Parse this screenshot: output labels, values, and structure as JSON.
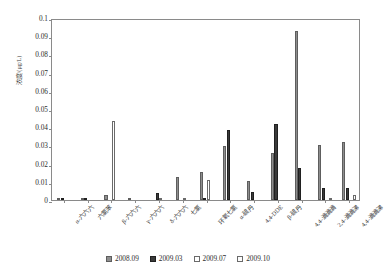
{
  "chart_data": {
    "type": "bar",
    "title": "",
    "xlabel": "",
    "ylabel": "浓度/(μg/L)",
    "ylim": [
      0,
      0.1
    ],
    "ytick_values": [
      0,
      0.01,
      0.02,
      0.03,
      0.04,
      0.05,
      0.06,
      0.07,
      0.08,
      0.09,
      0.1
    ],
    "ytick_labels": [
      "0",
      "0.01",
      "0.02",
      "0.03",
      "0.04",
      "0.05",
      "0.06",
      "0.07",
      "0.08",
      "0.09",
      "0.1"
    ],
    "grid": false,
    "legend_position": "bottom",
    "categories": [
      "α-六六六",
      "六氯苯",
      "β-六六六",
      "γ-六六六",
      "δ-六六六",
      "七氯",
      "环氧七氯",
      "α-硫丹",
      "4,4-DDE",
      "β-硫丹",
      "4,4-滴滴滴",
      "2,4-滴滴涕",
      "4,4-滴滴涕"
    ],
    "series": [
      {
        "name": "2008.09",
        "color": "#8e8e8e",
        "values": [
          0.0004,
          0.0003,
          0.0028,
          0.0012,
          0.0,
          0.0128,
          0.0155,
          0.0297,
          0.0105,
          0.0259,
          0.0928,
          0.0305,
          0.0318
        ]
      },
      {
        "name": "2009.03",
        "color": "#3a3a3a",
        "values": [
          0.0002,
          0.0005,
          0.0,
          0.0,
          0.0039,
          0.0,
          0.0013,
          0.0387,
          0.0044,
          0.0415,
          0.0174,
          0.0068,
          0.0068
        ]
      },
      {
        "name": "2009.07",
        "color": "#ffffff",
        "values": [
          0.0,
          0.0,
          0.0435,
          0.0,
          0.0004,
          0.0005,
          0.0108,
          0.0,
          0.0,
          0.0,
          0.0,
          0.0,
          0.0
        ]
      },
      {
        "name": "2009.10",
        "color": "#fcfcfc",
        "values": [
          0.0,
          0.0,
          0.0,
          0.0,
          0.0,
          0.0,
          0.0,
          0.0,
          0.0,
          0.0,
          0.0,
          0.0012,
          0.0028
        ]
      }
    ]
  },
  "legend": {
    "entries": [
      {
        "label": "2008.09",
        "swatch": "legend-swatch-2008-09"
      },
      {
        "label": "2009.03",
        "swatch": "legend-swatch-2009-03"
      },
      {
        "label": "2009.07",
        "swatch": "legend-swatch-2009-07"
      },
      {
        "label": "2009.10",
        "swatch": "legend-swatch-2009-10"
      }
    ]
  }
}
